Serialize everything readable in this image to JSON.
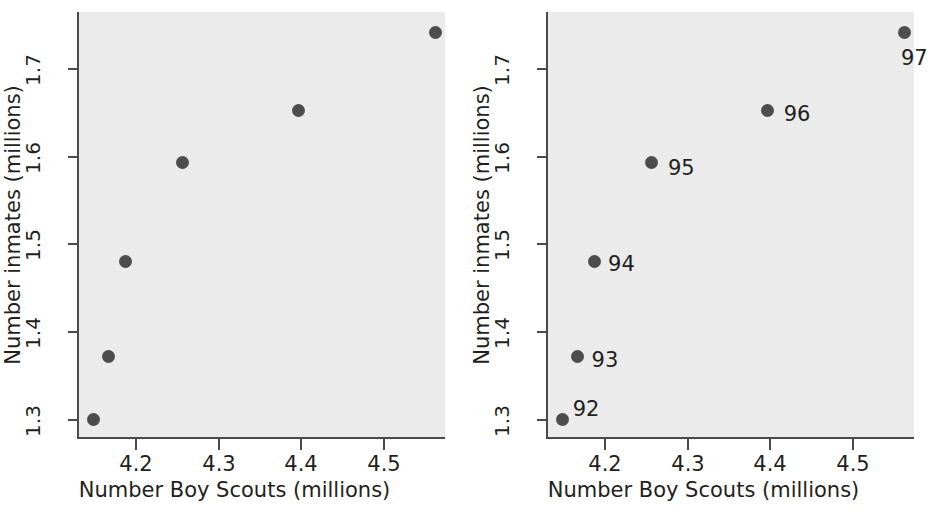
{
  "figure": {
    "background_color": "#ffffff",
    "plot_background_color": "#ebebeb",
    "marker_color": "#4d4d4d",
    "axis_color": "#4a4a4a",
    "text_color": "#231f20"
  },
  "chart_data": {
    "type": "scatter",
    "title": "",
    "xlabel": "Number Boy Scouts (millions)",
    "ylabel": "Number inmates (millions)",
    "xlim": [
      4.14,
      4.585
    ],
    "ylim": [
      1.295,
      1.78
    ],
    "xticks": [
      4.2,
      4.3,
      4.4,
      4.5
    ],
    "xticklabels": [
      "4.2",
      "4.3",
      "4.4",
      "4.5"
    ],
    "yticks": [
      1.3,
      1.4,
      1.5,
      1.6,
      1.7
    ],
    "yticklabels": [
      "1.3",
      "1.4",
      "1.5",
      "1.6",
      "1.7"
    ],
    "grid": false,
    "legend": false,
    "series": [
      {
        "name": "Boy Scouts vs inmates by year",
        "x": [
          4.15,
          4.168,
          4.188,
          4.258,
          4.398,
          4.564
        ],
        "y": [
          1.3,
          1.371,
          1.48,
          1.592,
          1.651,
          1.741
        ],
        "labels": [
          "92",
          "93",
          "94",
          "95",
          "96",
          "97"
        ]
      }
    ]
  },
  "panels": [
    {
      "id": "left",
      "name": "unlabeled-scatter",
      "show_point_labels": false,
      "xlabel": "Number Boy Scouts (millions)",
      "ylabel": "Number inmates (millions)",
      "xticklabels": [
        "4.2",
        "4.3",
        "4.4",
        "4.5"
      ],
      "yticklabels": [
        "1.3",
        "1.4",
        "1.5",
        "1.6",
        "1.7"
      ],
      "point_labels": [
        "",
        "",
        "",
        "",
        "",
        ""
      ]
    },
    {
      "id": "right",
      "name": "year-labeled-scatter",
      "show_point_labels": true,
      "xlabel": "Number Boy Scouts (millions)",
      "ylabel": "Number inmates (millions)",
      "xticklabels": [
        "4.2",
        "4.3",
        "4.4",
        "4.5"
      ],
      "yticklabels": [
        "1.3",
        "1.4",
        "1.5",
        "1.6",
        "1.7"
      ],
      "point_labels": [
        "92",
        "93",
        "94",
        "95",
        "96",
        "97"
      ]
    }
  ]
}
